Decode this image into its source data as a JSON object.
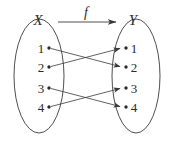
{
  "figure": {
    "type": "mapping-diagram",
    "caption_elements": {
      "domain_set_label": "X",
      "codomain_set_label": "Y",
      "function_label": "f"
    },
    "colors": {
      "background": "#ffffff",
      "stroke": "#3a3a3a",
      "text": "#2b2b2b"
    },
    "domain": {
      "name": "X",
      "elements": [
        {
          "label": "1",
          "x": 49,
          "y": 48
        },
        {
          "label": "2",
          "x": 49,
          "y": 67
        },
        {
          "label": "3",
          "x": 49,
          "y": 88
        },
        {
          "label": "4",
          "x": 49,
          "y": 107
        }
      ],
      "ellipse": {
        "cx": 39,
        "cy": 76,
        "rx": 25,
        "ry": 57
      }
    },
    "codomain": {
      "name": "Y",
      "elements": [
        {
          "label": "1",
          "x": 126,
          "y": 48
        },
        {
          "label": "2",
          "x": 126,
          "y": 67
        },
        {
          "label": "3",
          "x": 126,
          "y": 88
        },
        {
          "label": "4",
          "x": 126,
          "y": 107
        }
      ],
      "ellipse": {
        "cx": 136,
        "cy": 76,
        "rx": 24,
        "ry": 57
      }
    },
    "arrows": [
      {
        "from": "1",
        "to": "2",
        "x1": 50,
        "y1": 48,
        "x2": 121,
        "y2": 67
      },
      {
        "from": "2",
        "to": "1",
        "x1": 50,
        "y1": 67,
        "x2": 121,
        "y2": 48
      },
      {
        "from": "3",
        "to": "4",
        "x1": 50,
        "y1": 88,
        "x2": 121,
        "y2": 107
      },
      {
        "from": "4",
        "to": "3",
        "x1": 50,
        "y1": 107,
        "x2": 121,
        "y2": 88
      }
    ],
    "function_arrow": {
      "x1": 58,
      "y1": 22,
      "x2": 118,
      "y2": 22
    },
    "label_positions": {
      "X": {
        "x": 38,
        "y": 25
      },
      "Y": {
        "x": 133,
        "y": 25
      },
      "f": {
        "x": 85,
        "y": 17
      }
    }
  }
}
